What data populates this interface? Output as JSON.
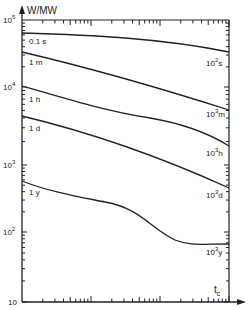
{
  "chart_data": {
    "type": "line",
    "title": "",
    "ylabel": "W/MW",
    "xlabel": "t_c",
    "y_scale": "log",
    "x_scale": "log",
    "ylim": [
      10,
      100000
    ],
    "y_ticks": [
      "10",
      "10^2",
      "10^3",
      "10^4",
      "10^5"
    ],
    "x_decades": 3,
    "grid": false,
    "legend": "inline curve labels",
    "series": [
      {
        "name": "0.1 s",
        "start_label": "0.1 s",
        "end_label": "10^2 s",
        "x_frac": [
          0,
          0.25,
          0.5,
          0.75,
          1
        ],
        "values": [
          70000,
          66000,
          58000,
          46000,
          33000
        ]
      },
      {
        "name": "1 m",
        "start_label": "1 m",
        "end_label": "10^3 m",
        "x_frac": [
          0,
          0.25,
          0.5,
          0.75,
          1
        ],
        "values": [
          33000,
          25000,
          17000,
          11000,
          5600
        ]
      },
      {
        "name": "1 h",
        "start_label": "1 h",
        "end_label": "10^3 h",
        "x_frac": [
          0,
          0.25,
          0.5,
          0.75,
          1
        ],
        "values": [
          10000,
          7000,
          4800,
          3300,
          1700
        ]
      },
      {
        "name": "1 d",
        "start_label": "1 d",
        "end_label": "10^3 d",
        "x_frac": [
          0,
          0.25,
          0.5,
          0.75,
          1
        ],
        "values": [
          4300,
          3000,
          2000,
          1300,
          480
        ]
      },
      {
        "name": "1 y",
        "start_label": "1 y",
        "end_label": "10^3 y",
        "x_frac": [
          0,
          0.25,
          0.5,
          0.65,
          0.75,
          1
        ],
        "values": [
          500,
          330,
          240,
          120,
          72,
          72
        ]
      }
    ]
  },
  "axes": {
    "y_title": "W/MW",
    "x_title": "t",
    "x_title_sub": "c",
    "y_tick_labels": [
      {
        "base": "10",
        "exp": "5"
      },
      {
        "base": "10",
        "exp": "4"
      },
      {
        "base": "10",
        "exp": "3"
      },
      {
        "base": "10",
        "exp": "2"
      },
      {
        "base": "10",
        "exp": ""
      }
    ]
  },
  "curves": [
    {
      "start": "0.1 s",
      "end_base": "10",
      "end_exp": "2",
      "end_unit": "s"
    },
    {
      "start": "1 m",
      "end_base": "10",
      "end_exp": "3",
      "end_unit": "m"
    },
    {
      "start": "1 h",
      "end_base": "10",
      "end_exp": "3",
      "end_unit": "h"
    },
    {
      "start": "1 d",
      "end_base": "10",
      "end_exp": "3",
      "end_unit": "d"
    },
    {
      "start": "1 y",
      "end_base": "10",
      "end_exp": "3",
      "end_unit": "y"
    }
  ]
}
